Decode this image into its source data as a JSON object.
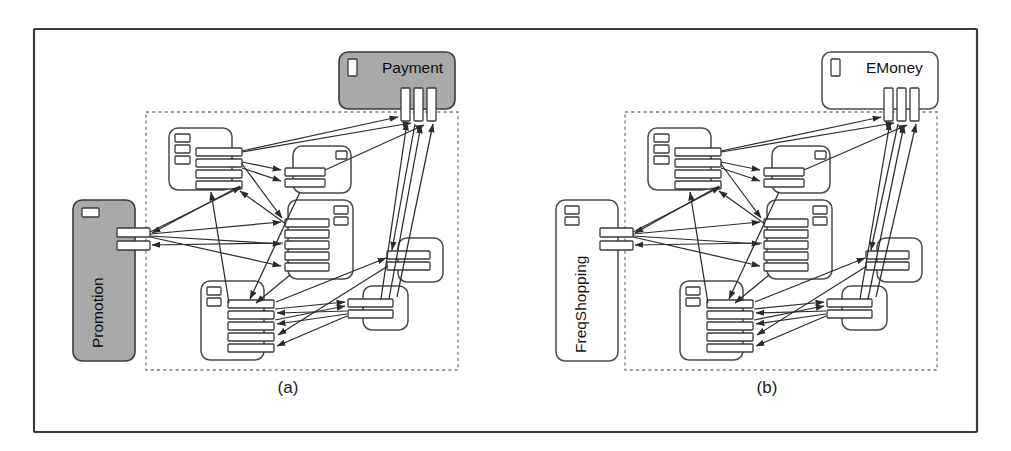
{
  "figure": {
    "type": "component-interaction-diagram",
    "panels": [
      {
        "id": "a",
        "caption": "(a)",
        "external_components": [
          {
            "name": "Payment",
            "role": "external-service-top",
            "fill": "#a9a9a9",
            "filled": true,
            "icon_count": 1,
            "port_count": 3,
            "port_orientation": "vertical",
            "label_orientation": "horizontal"
          },
          {
            "name": "Promotion",
            "role": "external-service-left",
            "fill": "#a9a9a9",
            "filled": true,
            "icon_count": 1,
            "port_count": 2,
            "port_orientation": "horizontal",
            "label_orientation": "vertical"
          }
        ],
        "inner_components": [
          {
            "id": "c1",
            "role": "top-left",
            "icon_count": 3,
            "port_count": 4,
            "port_side": "right"
          },
          {
            "id": "c2",
            "role": "top-right",
            "icon_count": 1,
            "port_count": 2,
            "port_side": "left"
          },
          {
            "id": "c3",
            "role": "middle",
            "icon_count": 2,
            "port_count": 5,
            "port_side": "left"
          },
          {
            "id": "c4",
            "role": "bottom-left",
            "icon_count": 2,
            "port_count": 5,
            "port_side": "right"
          },
          {
            "id": "c5",
            "role": "right-middle",
            "icon_count": 0,
            "port_count": 2,
            "port_side": "left"
          },
          {
            "id": "c6",
            "role": "bottom-right",
            "icon_count": 0,
            "port_count": 2,
            "port_side": "left"
          }
        ],
        "boundary": {
          "style": "dashed",
          "color": "#7a7a7a"
        }
      },
      {
        "id": "b",
        "caption": "(b)",
        "external_components": [
          {
            "name": "EMoney",
            "role": "external-service-top",
            "fill": "#ffffff",
            "filled": false,
            "icon_count": 1,
            "port_count": 3,
            "port_orientation": "vertical",
            "label_orientation": "horizontal"
          },
          {
            "name": "FreqShopping",
            "role": "external-service-left",
            "fill": "#ffffff",
            "filled": false,
            "icon_count": 2,
            "port_count": 2,
            "port_orientation": "horizontal",
            "label_orientation": "vertical"
          }
        ],
        "inner_components": [
          {
            "id": "c1",
            "role": "top-left",
            "icon_count": 3,
            "port_count": 4,
            "port_side": "right"
          },
          {
            "id": "c2",
            "role": "top-right",
            "icon_count": 1,
            "port_count": 2,
            "port_side": "left"
          },
          {
            "id": "c3",
            "role": "middle",
            "icon_count": 2,
            "port_count": 5,
            "port_side": "left"
          },
          {
            "id": "c4",
            "role": "bottom-left",
            "icon_count": 2,
            "port_count": 5,
            "port_side": "right"
          },
          {
            "id": "c5",
            "role": "right-middle",
            "icon_count": 0,
            "port_count": 2,
            "port_side": "left"
          },
          {
            "id": "c6",
            "role": "bottom-right",
            "icon_count": 0,
            "port_count": 2,
            "port_side": "left"
          }
        ],
        "boundary": {
          "style": "dashed",
          "color": "#7a7a7a"
        }
      }
    ],
    "colors": {
      "frame_stroke": "#3b3b3b",
      "component_stroke": "#4a4a4a",
      "edge_stroke": "#2b2b2b",
      "highlight_fill": "#a9a9a9",
      "background": "#ffffff"
    }
  }
}
